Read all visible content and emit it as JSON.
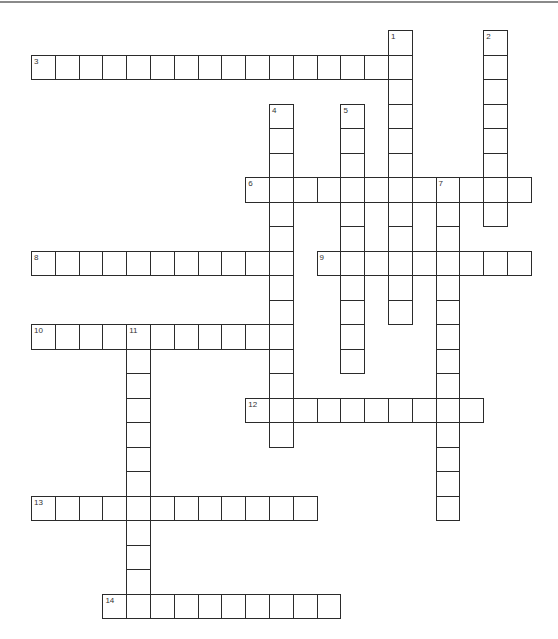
{
  "puzzle": {
    "type": "crossword",
    "grid": {
      "origin_x": 31,
      "origin_y": 30,
      "cell_w": 23.8,
      "cell_h": 24.5,
      "cols": 21,
      "rows": 24
    },
    "entries": [
      {
        "number": "1",
        "direction": "down",
        "row": 0,
        "col": 15,
        "length": 12
      },
      {
        "number": "2",
        "direction": "down",
        "row": 0,
        "col": 19,
        "length": 8
      },
      {
        "number": "3",
        "direction": "across",
        "row": 1,
        "col": 0,
        "length": 16
      },
      {
        "number": "4",
        "direction": "down",
        "row": 3,
        "col": 10,
        "length": 14
      },
      {
        "number": "5",
        "direction": "down",
        "row": 3,
        "col": 13,
        "length": 11
      },
      {
        "number": "6",
        "direction": "across",
        "row": 6,
        "col": 9,
        "length": 12
      },
      {
        "number": "7",
        "direction": "down",
        "row": 6,
        "col": 17,
        "length": 14
      },
      {
        "number": "8",
        "direction": "across",
        "row": 9,
        "col": 0,
        "length": 11
      },
      {
        "number": "9",
        "direction": "across",
        "row": 9,
        "col": 12,
        "length": 9
      },
      {
        "number": "10",
        "direction": "across",
        "row": 12,
        "col": 0,
        "length": 11
      },
      {
        "number": "11",
        "direction": "down",
        "row": 12,
        "col": 4,
        "length": 12
      },
      {
        "number": "12",
        "direction": "across",
        "row": 15,
        "col": 9,
        "length": 10
      },
      {
        "number": "13",
        "direction": "across",
        "row": 19,
        "col": 0,
        "length": 12
      },
      {
        "number": "14",
        "direction": "across",
        "row": 23,
        "col": 3,
        "length": 10
      }
    ]
  }
}
